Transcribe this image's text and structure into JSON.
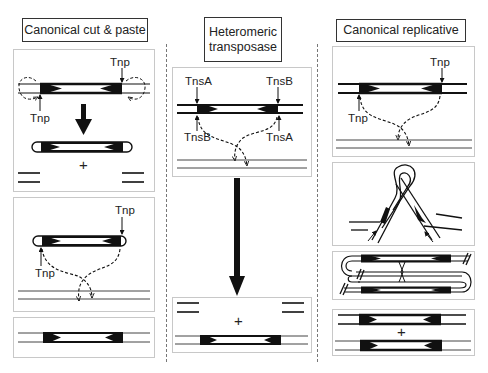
{
  "columns": [
    {
      "id": "cut-paste",
      "title": "Canonical cut & paste",
      "labels": {
        "p1_top_right": "Tnp",
        "p1_bottom_left": "Tnp",
        "p1_plus": "+",
        "p2_top_right": "Tnp",
        "p2_bottom_left": "Tnp"
      }
    },
    {
      "id": "heteromeric",
      "title_line1": "Heteromeric",
      "title_line2": "transposase",
      "labels": {
        "p1_top_left": "TnsA",
        "p1_top_right": "TnsB",
        "p1_bottom_left": "TnsB",
        "p1_bottom_right": "TnsA",
        "p2_plus": "+"
      }
    },
    {
      "id": "replicative",
      "title": "Canonical replicative",
      "labels": {
        "p1_top_right": "Tnp",
        "p1_bottom_left": "Tnp",
        "p4_plus": "+"
      }
    }
  ],
  "colors": {
    "dna": "#111111",
    "panel_border": "#c8c8c8",
    "title_border": "#333333",
    "divider": "#777777"
  }
}
